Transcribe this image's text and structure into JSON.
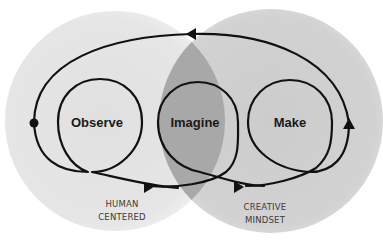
{
  "diagram": {
    "title": "",
    "colors": {
      "background": "#ffffff",
      "left_circle": "#e4e4e4",
      "right_circle": "#cfcfcf",
      "overlap": "#a9a9a9",
      "stroke": "#111111",
      "text": "#1a1a1a",
      "area_text": "#3a3a3a"
    },
    "areas": [
      {
        "id": "human-centered",
        "line1": "HUMAN",
        "line2": "CENTERED"
      },
      {
        "id": "creative-mindset",
        "line1": "CREATIVE",
        "line2": "MINDSET"
      }
    ],
    "stages": [
      {
        "id": "observe",
        "label": "Observe"
      },
      {
        "id": "imagine",
        "label": "Imagine"
      },
      {
        "id": "make",
        "label": "Make"
      }
    ],
    "markers": {
      "start": "dot-icon",
      "arrows": [
        "arrow-left-icon",
        "arrow-right-icon",
        "arrow-right-icon",
        "arrow-up-icon"
      ]
    }
  }
}
